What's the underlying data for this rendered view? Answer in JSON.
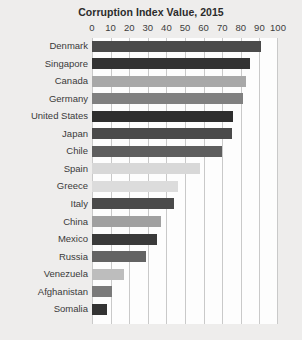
{
  "chart_data": {
    "type": "bar",
    "orientation": "horizontal",
    "title": "Corruption Index Value, 2015",
    "xlabel": "",
    "ylabel": "",
    "xlim": [
      0,
      100
    ],
    "xticks": [
      0,
      10,
      20,
      30,
      40,
      50,
      60,
      70,
      80,
      90,
      100
    ],
    "grid": true,
    "legend": false,
    "categories": [
      "Denmark",
      "Singapore",
      "Canada",
      "Germany",
      "United States",
      "Japan",
      "Chile",
      "Spain",
      "Greece",
      "Italy",
      "China",
      "Mexico",
      "Russia",
      "Venezuela",
      "Afghanistan",
      "Somalia"
    ],
    "values": [
      91,
      85,
      83,
      81,
      76,
      75,
      70,
      58,
      46,
      44,
      37,
      35,
      29,
      17,
      11,
      8
    ],
    "bar_colors": [
      "#4a4a4a",
      "#333333",
      "#a8a8a8",
      "#808080",
      "#2e2e2e",
      "#4a4a4a",
      "#5e5e5e",
      "#d8d8d8",
      "#dcdcdc",
      "#4a4a4a",
      "#a0a0a0",
      "#3a3a3a",
      "#636363",
      "#bdbdbd",
      "#7a7a7a",
      "#333333"
    ]
  },
  "style": {
    "background": "#eeedec",
    "plot_background": "#fdfdfd",
    "gridline_color": "#c9c9c9",
    "title_color": "#2b2b2b",
    "label_color": "#3a3a3a"
  }
}
